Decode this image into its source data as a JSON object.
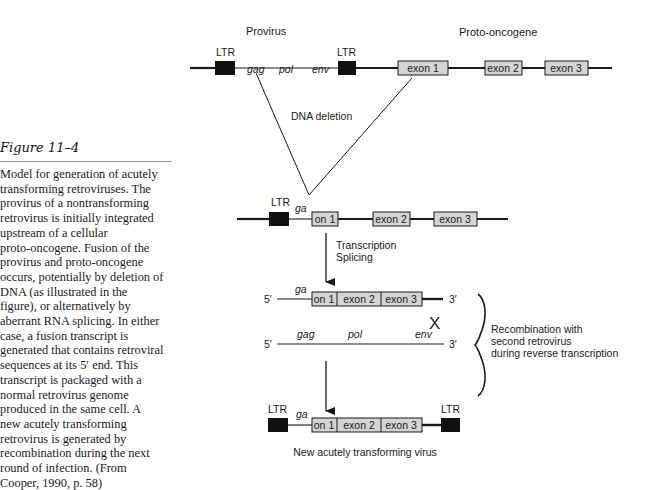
{
  "caption": {
    "title": "Figure 11–4",
    "lines": [
      "Model for generation of acutely",
      "transforming retroviruses. The",
      "provirus of a nontransforming",
      "retrovirus is initially integrated",
      "upstream of a cellular",
      "proto-oncogene. Fusion of the",
      "provirus and proto-oncogene",
      "occurs, potentially by deletion of",
      "DNA (as illustrated in the",
      "figure), or alternatively by",
      "aberrant RNA splicing. In either",
      "case, a fusion transcript is",
      "generated that contains retroviral",
      "sequences at its 5′ end. This",
      "transcript is packaged with a",
      "normal retrovirus genome",
      "produced in the same cell. A",
      "new acutely transforming",
      "retrovirus is generated by",
      "recombination during the next",
      "round of infection. (From",
      "Cooper, 1990, p. 58)"
    ]
  },
  "diagram": {
    "top": {
      "provirus_label": "Provirus",
      "protooncogene_label": "Proto-oncogene",
      "ltr_left": "LTR",
      "ltr_right": "LTR",
      "gag": "gag",
      "pol": "pol",
      "env": "env",
      "exon1": "exon 1",
      "exon2": "exon 2",
      "exon3": "exon 3"
    },
    "deletion_label": "DNA deletion",
    "fused": {
      "ltr": "LTR",
      "ga": "ga",
      "on1": "on 1",
      "exon2": "exon 2",
      "exon3": "exon 3"
    },
    "step_label_1": "Transcription",
    "step_label_2": "Splicing",
    "transcript": {
      "five_prime": "5′",
      "three_prime": "3′",
      "ga": "ga",
      "on1": "on 1",
      "exon2": "exon 2",
      "exon3": "exon 3"
    },
    "cross_mark": "X",
    "genome": {
      "five_prime": "5′",
      "three_prime": "3′",
      "gag": "gag",
      "pol": "pol",
      "env": "env"
    },
    "recombination_lines": [
      "Recombination with",
      "second retrovirus",
      "during reverse transcription"
    ],
    "final": {
      "ltr_left": "LTR",
      "ltr_right": "LTR",
      "ga": "ga",
      "on1": "on 1",
      "exon2": "exon 2",
      "exon3": "exon 3",
      "label": "New acutely transforming virus"
    },
    "colors": {
      "exon_fill": "#d4d4d4",
      "ltr_fill": "#111111",
      "line": "#1a1a1a"
    }
  }
}
